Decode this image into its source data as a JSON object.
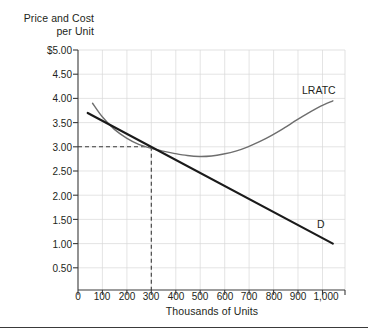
{
  "figure": {
    "y_axis_title_line1": "Price and Cost",
    "y_axis_title_line2": "per Unit",
    "x_axis_title": "Thousands of Units",
    "label_lratc": "LRATC",
    "label_d": "D"
  },
  "chart_data": {
    "type": "line",
    "title": "",
    "xlabel": "Thousands of Units",
    "ylabel": "Price and Cost per Unit",
    "xlim": [
      0,
      1100
    ],
    "ylim": [
      0,
      5.0
    ],
    "grid": true,
    "legend_position": "inline-curve-labels",
    "xticks": [
      0,
      100,
      200,
      300,
      400,
      500,
      600,
      700,
      800,
      900,
      1000
    ],
    "xtick_labels": [
      "0",
      "100",
      "200",
      "300",
      "400",
      "500",
      "600",
      "700",
      "800",
      "900",
      "1,000"
    ],
    "yticks": [
      0.5,
      1.0,
      1.5,
      2.0,
      2.5,
      3.0,
      3.5,
      4.0,
      4.5,
      5.0
    ],
    "ytick_labels": [
      "0.50",
      "1.00",
      "1.50",
      "2.00",
      "2.50",
      "3.00",
      "3.50",
      "4.00",
      "4.50",
      "$5.00"
    ],
    "series": [
      {
        "name": "D",
        "label": "D",
        "color": "#1a1a1a",
        "width": 2.2,
        "style": "solid",
        "points": [
          [
            40,
            3.7
          ],
          [
            1050,
            1.0
          ]
        ]
      },
      {
        "name": "LRATC",
        "label": "LRATC",
        "color": "#6e6e6e",
        "width": 1.4,
        "style": "solid",
        "points": [
          [
            60,
            3.9
          ],
          [
            100,
            3.62
          ],
          [
            150,
            3.36
          ],
          [
            200,
            3.18
          ],
          [
            250,
            3.05
          ],
          [
            300,
            2.97
          ],
          [
            350,
            2.91
          ],
          [
            400,
            2.86
          ],
          [
            450,
            2.82
          ],
          [
            500,
            2.8
          ],
          [
            550,
            2.81
          ],
          [
            600,
            2.85
          ],
          [
            650,
            2.91
          ],
          [
            700,
            3.0
          ],
          [
            750,
            3.11
          ],
          [
            800,
            3.24
          ],
          [
            850,
            3.39
          ],
          [
            900,
            3.55
          ],
          [
            950,
            3.7
          ],
          [
            1000,
            3.84
          ],
          [
            1050,
            3.95
          ]
        ]
      }
    ],
    "annotations": [
      {
        "name": "equilibrium-guide-horizontal",
        "style": "dashed",
        "color": "#3a3a3a",
        "from": [
          0,
          3.0
        ],
        "to": [
          300,
          3.0
        ]
      },
      {
        "name": "equilibrium-guide-vertical",
        "style": "dashed",
        "color": "#3a3a3a",
        "from": [
          300,
          0
        ],
        "to": [
          300,
          3.0
        ]
      }
    ],
    "intersection": {
      "x": 300,
      "y": 3.0
    }
  }
}
